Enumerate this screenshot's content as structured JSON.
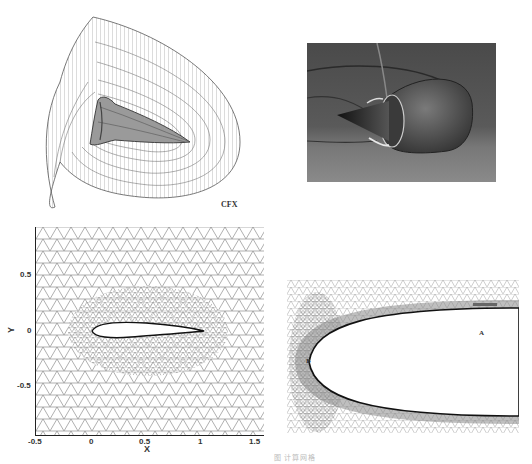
{
  "figure": {
    "panels": [
      {
        "id": "cfx-3d-mesh",
        "type": "3d-structured-wireframe-mesh",
        "label": "CFX"
      },
      {
        "id": "engine-nacelle-render",
        "type": "shaded-3d-render"
      },
      {
        "id": "airfoil-mesh",
        "type": "2d-unstructured-triangular-mesh"
      },
      {
        "id": "blunt-body-mesh",
        "type": "2d-hybrid-mesh",
        "markers": [
          "A",
          "B"
        ]
      }
    ],
    "caption": "图  计算网格"
  },
  "cfx_panel": {
    "label": "CFX"
  },
  "airfoil_plot": {
    "xlabel": "X",
    "ylabel": "Y",
    "xticks": [
      "-0.5",
      "0",
      "0.5",
      "1",
      "1.5"
    ],
    "yticks": [
      "0.5",
      "0",
      "-0.5"
    ],
    "xlim": [
      -0.5,
      1.55
    ],
    "ylim": [
      -0.95,
      0.95
    ]
  },
  "blunt_body": {
    "marker_a": "A",
    "marker_b": "B"
  },
  "colors": {
    "mesh_line": "#7a7a7a",
    "render_dark": "#3a3a3a",
    "render_mid": "#6e6e6e",
    "background": "#ffffff"
  }
}
